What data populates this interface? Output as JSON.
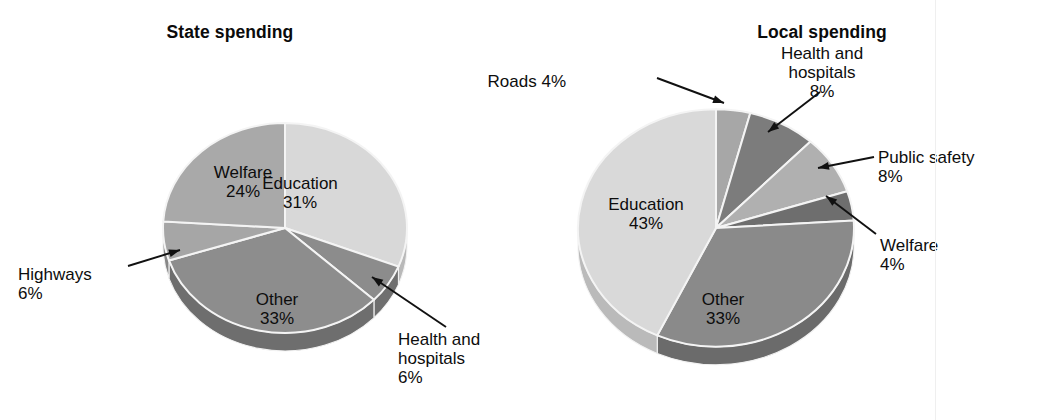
{
  "figure": {
    "background_color": "#ffffff",
    "text_color": "#0d0d0d"
  },
  "charts": [
    {
      "id": "state-spending",
      "title": "State spending",
      "type": "pie",
      "center": {
        "x": 285,
        "y": 228
      },
      "radius": 122,
      "depth": 18,
      "start_angle_deg": -90,
      "slices": [
        {
          "name": "Education",
          "label": "Education",
          "value_text": "31%",
          "value": 31,
          "color": "#d8d8d8",
          "side_color": "#b9b9b9",
          "label_placement": "inside",
          "label_x": 300,
          "label_y": 174,
          "align": "center"
        },
        {
          "name": "Health and hospitals",
          "label": "Health and\nhospitals",
          "value_text": "6%",
          "value": 6,
          "color": "#8c8c8c",
          "side_color": "#6f6f6f",
          "label_placement": "callout",
          "label_x": 398,
          "label_y": 330,
          "align": "left",
          "leader": {
            "x1": 446,
            "y1": 327,
            "x2": 372,
            "y2": 277
          }
        },
        {
          "name": "Other",
          "label": "Other",
          "value_text": "33%",
          "value": 33,
          "color": "#8d8d8d",
          "side_color": "#6e6e6e",
          "label_placement": "inside",
          "label_x": 277,
          "label_y": 290,
          "align": "center"
        },
        {
          "name": "Highways",
          "label": "Highways",
          "value_text": "6%",
          "value": 6,
          "color": "#a6a6a6",
          "side_color": "#878787",
          "label_placement": "callout",
          "label_x": 18,
          "label_y": 265,
          "align": "left",
          "leader": {
            "x1": 128,
            "y1": 266,
            "x2": 180,
            "y2": 250
          }
        },
        {
          "name": "Welfare",
          "label": "Welfare",
          "value_text": "24%",
          "value": 24,
          "color": "#a9a9a9",
          "side_color": "#8a8a8a",
          "label_placement": "inside",
          "label_x": 243,
          "label_y": 163,
          "align": "center"
        }
      ]
    },
    {
      "id": "local-spending",
      "title": "Local spending",
      "type": "pie",
      "center": {
        "x": 716,
        "y": 228
      },
      "radius": 138,
      "depth": 18,
      "start_angle_deg": -90,
      "slices": [
        {
          "name": "Roads",
          "label": "Roads 4%",
          "value_text": "",
          "value": 4,
          "color": "#a7a7a7",
          "side_color": "#888888",
          "label_placement": "callout",
          "label_x": 566,
          "label_y": 72,
          "align": "right",
          "leader": {
            "x1": 657,
            "y1": 78,
            "x2": 724,
            "y2": 103
          }
        },
        {
          "name": "Health and hospitals",
          "label": "Health and\nhospitals",
          "value_text": "8%",
          "value": 8,
          "color": "#7c7c7c",
          "side_color": "#606060",
          "label_placement": "callout",
          "label_x": 822,
          "label_y": 44,
          "align": "center",
          "leader": {
            "x1": 820,
            "y1": 92,
            "x2": 768,
            "y2": 132
          }
        },
        {
          "name": "Public safety",
          "label": "Public safety",
          "value_text": "8%",
          "value": 8,
          "color": "#b0b0b0",
          "side_color": "#909090",
          "label_placement": "callout",
          "label_x": 878,
          "label_y": 148,
          "align": "left",
          "leader": {
            "x1": 874,
            "y1": 157,
            "x2": 818,
            "y2": 168
          }
        },
        {
          "name": "Welfare",
          "label": "Welfare",
          "value_text": "4%",
          "value": 4,
          "color": "#6e6e6e",
          "side_color": "#585858",
          "label_placement": "callout",
          "label_x": 880,
          "label_y": 236,
          "align": "left",
          "leader": {
            "x1": 876,
            "y1": 234,
            "x2": 826,
            "y2": 196
          }
        },
        {
          "name": "Other",
          "label": "Other",
          "value_text": "33%",
          "value": 33,
          "color": "#8a8a8a",
          "side_color": "#6b6b6b",
          "label_placement": "inside",
          "label_x": 723,
          "label_y": 290,
          "align": "center"
        },
        {
          "name": "Education",
          "label": "Education",
          "value_text": "43%",
          "value": 43,
          "color": "#d9d9d9",
          "side_color": "#bababa",
          "label_placement": "inside",
          "label_x": 646,
          "label_y": 195,
          "align": "center"
        }
      ]
    }
  ],
  "chart_data": [
    {
      "type": "pie",
      "title": "State spending",
      "categories": [
        "Education",
        "Health and hospitals",
        "Other",
        "Highways",
        "Welfare"
      ],
      "values": [
        31,
        6,
        33,
        6,
        24
      ],
      "value_labels": [
        "31%",
        "6%",
        "33%",
        "6%",
        "24%"
      ],
      "unit": "percent",
      "legend": "none",
      "labels_inside": [
        "Education 31%",
        "Other 33%",
        "Welfare 24%"
      ],
      "labels_callout": [
        "Health and hospitals 6%",
        "Highways 6%"
      ]
    },
    {
      "type": "pie",
      "title": "Local spending",
      "categories": [
        "Roads",
        "Health and hospitals",
        "Public safety",
        "Welfare",
        "Other",
        "Education"
      ],
      "values": [
        4,
        8,
        8,
        4,
        33,
        43
      ],
      "value_labels": [
        "4%",
        "8%",
        "8%",
        "4%",
        "33%",
        "43%"
      ],
      "unit": "percent",
      "legend": "none",
      "labels_inside": [
        "Education 43%",
        "Other 33%"
      ],
      "labels_callout": [
        "Roads 4%",
        "Health and hospitals 8%",
        "Public safety 8%",
        "Welfare 4%"
      ]
    }
  ]
}
